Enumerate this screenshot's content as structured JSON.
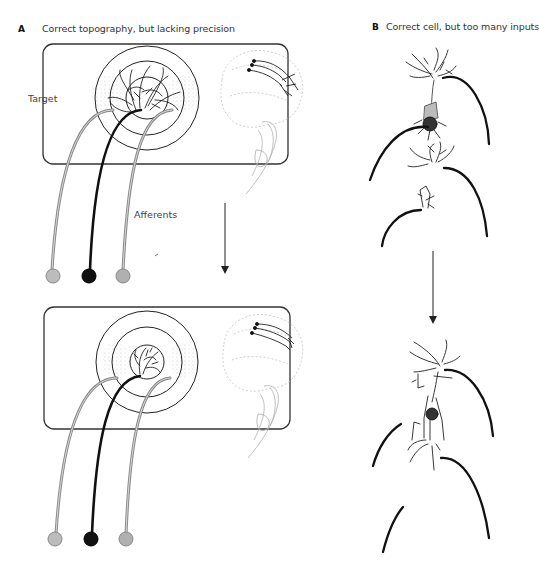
{
  "panels": [
    {
      "letter": "A",
      "title": "Correct topography, but lacking precision",
      "labels": {
        "target": "Target",
        "afferents": "Afferents"
      },
      "stages": [
        "before",
        "after"
      ],
      "afferent_colors": [
        "#a8a8a8",
        "#111111",
        "#a8a8a8"
      ]
    },
    {
      "letter": "B",
      "title": "Correct cell, but too many inputs",
      "stages": [
        "before",
        "after"
      ]
    }
  ],
  "colors": {
    "ink": "#111111",
    "grey_axon": "#9a9a9a",
    "stipple": "#bdbdbd",
    "background": "#ffffff"
  }
}
